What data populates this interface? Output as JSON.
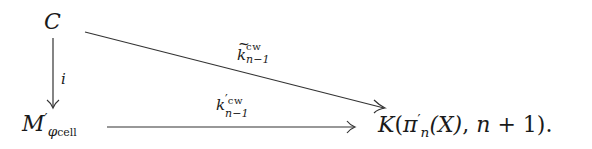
{
  "diagram": {
    "type": "commutative-diagram",
    "nodes": {
      "C": {
        "main": "C"
      },
      "M": {
        "main": "M",
        "prime": "′",
        "sub_greek": "φ",
        "sub_text": "cell"
      },
      "K": {
        "main": "K",
        "open": "(",
        "pi": "π",
        "prime": "′",
        "sub": "n",
        "arg": "(X)",
        "sep": ",",
        "n": "n",
        "plus": "+",
        "one": "1",
        "close": ")",
        "period": "."
      }
    },
    "arrows": [
      {
        "id": "i",
        "from": "C",
        "to": "M",
        "label": "i"
      },
      {
        "id": "k-tilde",
        "from": "C",
        "to": "K",
        "label_main": "k",
        "label_sup": "cw",
        "label_sub": "n−1",
        "decoration": "tilde"
      },
      {
        "id": "k-prime",
        "from": "M",
        "to": "K",
        "label_main": "k",
        "label_prime": "′",
        "label_sup": "cw",
        "label_sub": "n−1"
      }
    ]
  }
}
